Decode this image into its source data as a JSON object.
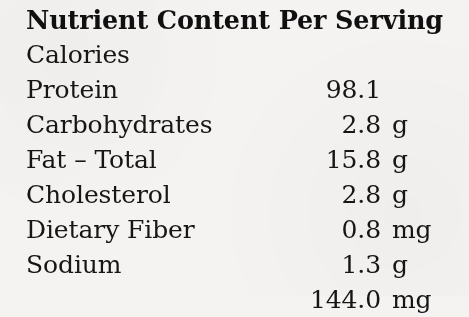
{
  "document": {
    "title": "Nutrient Content Per Serving",
    "background_color": "#f4f3f1",
    "text_color": "#161616"
  },
  "nutrition_table": {
    "columns": [
      "Nutrient",
      "Amount",
      "Unit"
    ],
    "rows": [
      {
        "name": "Calories",
        "amount": "98.1",
        "unit": ""
      },
      {
        "name": "Protein",
        "amount": "2.8",
        "unit": "g"
      },
      {
        "name": "Carbohydrates",
        "amount": "15.8",
        "unit": "g"
      },
      {
        "name": "Fat – Total",
        "amount": "2.8",
        "unit": "g"
      },
      {
        "name": "Cholesterol",
        "amount": "0.8",
        "unit": "mg"
      },
      {
        "name": "Dietary Fiber",
        "amount": "1.3",
        "unit": "g"
      },
      {
        "name": "Sodium",
        "amount": "144.0",
        "unit": "mg"
      }
    ]
  }
}
